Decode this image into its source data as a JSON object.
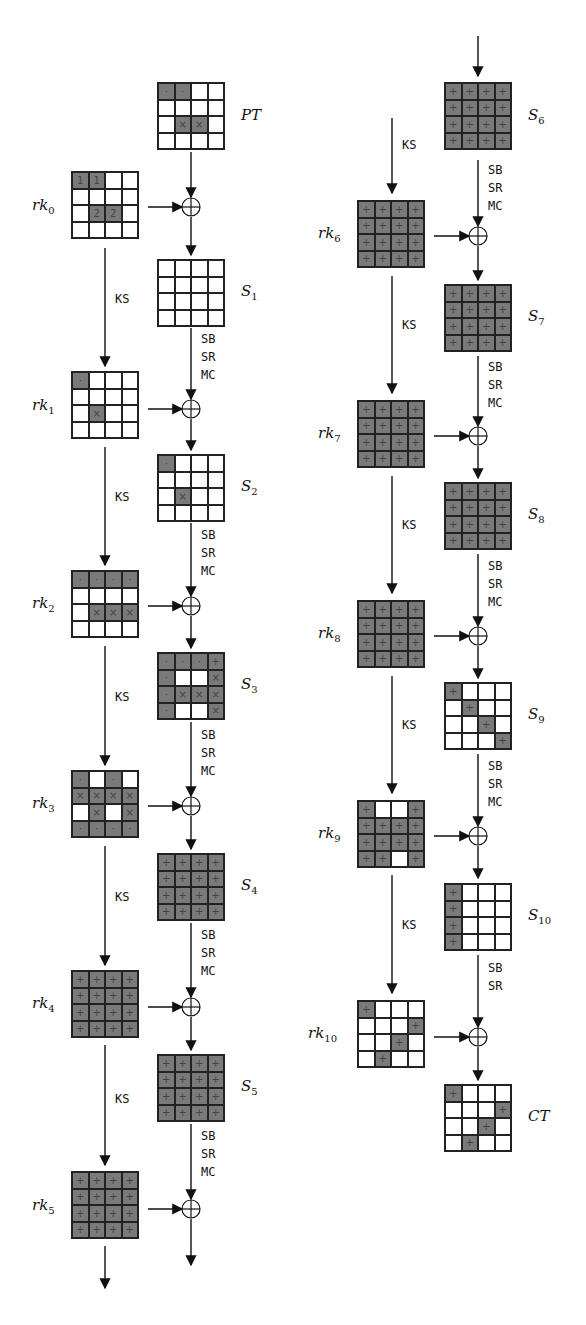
{
  "diagram": {
    "type": "AES-128 trail (11 rounds) with key schedule",
    "ops": {
      "ks": "KS",
      "sb": "SB",
      "sr": "SR",
      "mc": "MC"
    },
    "states": [
      {
        "id": "PT",
        "label": "PT",
        "sub": "",
        "cells": [
          [
            "·",
            "·",
            "",
            ""
          ],
          [
            "",
            "",
            "",
            ""
          ],
          [
            "",
            "×",
            "×",
            ""
          ],
          [
            "",
            "",
            "",
            ""
          ]
        ]
      },
      {
        "id": "S1",
        "label": "S",
        "sub": "1",
        "cells": [
          [
            "",
            "",
            "",
            ""
          ],
          [
            "",
            "",
            "",
            ""
          ],
          [
            "",
            "",
            "",
            ""
          ],
          [
            "",
            "",
            "",
            ""
          ]
        ]
      },
      {
        "id": "S2",
        "label": "S",
        "sub": "2",
        "cells": [
          [
            "·",
            "",
            "",
            ""
          ],
          [
            "",
            "",
            "",
            ""
          ],
          [
            "",
            "×",
            "",
            ""
          ],
          [
            "",
            "",
            "",
            ""
          ]
        ]
      },
      {
        "id": "S3",
        "label": "S",
        "sub": "3",
        "cells": [
          [
            "·",
            "·",
            "·",
            "+"
          ],
          [
            "·",
            "",
            "",
            "×"
          ],
          [
            "·",
            "×",
            "×",
            "×"
          ],
          [
            "·",
            "",
            "",
            "×"
          ]
        ]
      },
      {
        "id": "S4",
        "label": "S",
        "sub": "4",
        "cells": [
          [
            "+",
            "+",
            "+",
            "+"
          ],
          [
            "+",
            "+",
            "+",
            "+"
          ],
          [
            "+",
            "+",
            "+",
            "+"
          ],
          [
            "+",
            "+",
            "+",
            "+"
          ]
        ]
      },
      {
        "id": "S5",
        "label": "S",
        "sub": "5",
        "cells": [
          [
            "+",
            "+",
            "+",
            "+"
          ],
          [
            "+",
            "+",
            "+",
            "+"
          ],
          [
            "+",
            "+",
            "+",
            "+"
          ],
          [
            "+",
            "+",
            "+",
            "+"
          ]
        ]
      },
      {
        "id": "S6",
        "label": "S",
        "sub": "6",
        "cells": [
          [
            "+",
            "+",
            "+",
            "+"
          ],
          [
            "+",
            "+",
            "+",
            "+"
          ],
          [
            "+",
            "+",
            "+",
            "+"
          ],
          [
            "+",
            "+",
            "+",
            "+"
          ]
        ]
      },
      {
        "id": "S7",
        "label": "S",
        "sub": "7",
        "cells": [
          [
            "+",
            "+",
            "+",
            "+"
          ],
          [
            "+",
            "+",
            "+",
            "+"
          ],
          [
            "+",
            "+",
            "+",
            "+"
          ],
          [
            "+",
            "+",
            "+",
            "+"
          ]
        ]
      },
      {
        "id": "S8",
        "label": "S",
        "sub": "8",
        "cells": [
          [
            "+",
            "+",
            "+",
            "+"
          ],
          [
            "+",
            "+",
            "+",
            "+"
          ],
          [
            "+",
            "+",
            "+",
            "+"
          ],
          [
            "+",
            "+",
            "+",
            "+"
          ]
        ]
      },
      {
        "id": "S9",
        "label": "S",
        "sub": "9",
        "cells": [
          [
            "+",
            "",
            "",
            ""
          ],
          [
            "",
            "+",
            "",
            ""
          ],
          [
            "",
            "",
            "+",
            ""
          ],
          [
            "",
            "",
            "",
            "+"
          ]
        ]
      },
      {
        "id": "S10",
        "label": "S",
        "sub": "10",
        "cells": [
          [
            "+",
            "",
            "",
            ""
          ],
          [
            "+",
            "",
            "",
            ""
          ],
          [
            "+",
            "",
            "",
            ""
          ],
          [
            "+",
            "",
            "",
            ""
          ]
        ]
      },
      {
        "id": "CT",
        "label": "CT",
        "sub": "",
        "cells": [
          [
            "+",
            "",
            "",
            ""
          ],
          [
            "",
            "",
            "",
            "+"
          ],
          [
            "",
            "",
            "+",
            ""
          ],
          [
            "",
            "+",
            "",
            ""
          ]
        ]
      }
    ],
    "round_keys": [
      {
        "id": "rk0",
        "label": "rk",
        "sub": "0",
        "cells": [
          [
            "1",
            "1",
            "",
            ""
          ],
          [
            "",
            "",
            "",
            ""
          ],
          [
            "",
            "2",
            "2",
            ""
          ],
          [
            "",
            "",
            "",
            ""
          ]
        ]
      },
      {
        "id": "rk1",
        "label": "rk",
        "sub": "1",
        "cells": [
          [
            "·",
            "",
            "",
            ""
          ],
          [
            "",
            "",
            "",
            ""
          ],
          [
            "",
            "×",
            "",
            ""
          ],
          [
            "",
            "",
            "",
            ""
          ]
        ]
      },
      {
        "id": "rk2",
        "label": "rk",
        "sub": "2",
        "cells": [
          [
            "·",
            "·",
            "·",
            "·"
          ],
          [
            "",
            "",
            "",
            ""
          ],
          [
            "",
            "×",
            "×",
            "×"
          ],
          [
            "",
            "",
            "",
            ""
          ]
        ]
      },
      {
        "id": "rk3",
        "label": "rk",
        "sub": "3",
        "cells": [
          [
            "·",
            "",
            "·",
            ""
          ],
          [
            "×",
            "×",
            "×",
            "×"
          ],
          [
            "",
            "×",
            "",
            "×"
          ],
          [
            "·",
            "·",
            "·",
            "·"
          ]
        ]
      },
      {
        "id": "rk4",
        "label": "rk",
        "sub": "4",
        "cells": [
          [
            "+",
            "+",
            "+",
            "+"
          ],
          [
            "+",
            "+",
            "+",
            "+"
          ],
          [
            "+",
            "+",
            "+",
            "+"
          ],
          [
            "+",
            "+",
            "+",
            "+"
          ]
        ]
      },
      {
        "id": "rk5",
        "label": "rk",
        "sub": "5",
        "cells": [
          [
            "+",
            "+",
            "+",
            "+"
          ],
          [
            "+",
            "+",
            "+",
            "+"
          ],
          [
            "+",
            "+",
            "+",
            "+"
          ],
          [
            "+",
            "+",
            "+",
            "+"
          ]
        ]
      },
      {
        "id": "rk6",
        "label": "rk",
        "sub": "6",
        "cells": [
          [
            "+",
            "+",
            "+",
            "+"
          ],
          [
            "+",
            "+",
            "+",
            "+"
          ],
          [
            "+",
            "+",
            "+",
            "+"
          ],
          [
            "+",
            "+",
            "+",
            "+"
          ]
        ]
      },
      {
        "id": "rk7",
        "label": "rk",
        "sub": "7",
        "cells": [
          [
            "+",
            "+",
            "+",
            "+"
          ],
          [
            "+",
            "+",
            "+",
            "+"
          ],
          [
            "+",
            "+",
            "+",
            "+"
          ],
          [
            "+",
            "+",
            "+",
            "+"
          ]
        ]
      },
      {
        "id": "rk8",
        "label": "rk",
        "sub": "8",
        "cells": [
          [
            "+",
            "+",
            "+",
            "+"
          ],
          [
            "+",
            "+",
            "+",
            "+"
          ],
          [
            "+",
            "+",
            "+",
            "+"
          ],
          [
            "+",
            "+",
            "+",
            "+"
          ]
        ]
      },
      {
        "id": "rk9",
        "label": "rk",
        "sub": "9",
        "cells": [
          [
            "+",
            "",
            "",
            "+"
          ],
          [
            "+",
            "+",
            "+",
            "+"
          ],
          [
            "+",
            "+",
            "+",
            "+"
          ],
          [
            "+",
            "+",
            "",
            "+"
          ]
        ]
      },
      {
        "id": "rk10",
        "label": "rk",
        "sub": "10",
        "cells": [
          [
            "+",
            "",
            "",
            ""
          ],
          [
            "",
            "",
            "",
            "+"
          ],
          [
            "",
            "",
            "+",
            ""
          ],
          [
            "",
            "+",
            "",
            ""
          ]
        ]
      }
    ]
  }
}
